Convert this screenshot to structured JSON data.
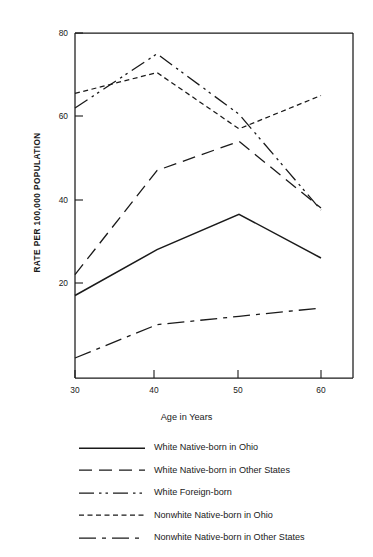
{
  "chart_data": {
    "type": "line",
    "title": "",
    "xlabel": "Age in Years",
    "ylabel": "RATE PER 100,000 POPULATION",
    "x": [
      30,
      40,
      50,
      60
    ],
    "xticks": [
      "30",
      "40",
      "50",
      "60"
    ],
    "yticks": [
      "20",
      "40",
      "60",
      "80"
    ],
    "xlim": [
      27.5,
      64
    ],
    "ylim": [
      0,
      82
    ],
    "grid": false,
    "legend_position": "below-plot",
    "series": [
      {
        "name": "White Native-born in Ohio",
        "line_style": "solid",
        "values": [
          17.0,
          28.0,
          36.5,
          26.0
        ]
      },
      {
        "name": "White Native-born in Other States",
        "line_style": "long-dash",
        "values": [
          22.0,
          47.0,
          54.0,
          38.0
        ]
      },
      {
        "name": "White Foreign-born",
        "line_style": "dash-dot-dot",
        "values": [
          62.0,
          75.0,
          60.5,
          37.5
        ]
      },
      {
        "name": "Nonwhite Native-born in Ohio",
        "line_style": "short-dash",
        "values": [
          65.5,
          70.5,
          57.0,
          65.0
        ]
      },
      {
        "name": "Nonwhite Native-born in Other States",
        "line_style": "dash-dot",
        "values": [
          2.0,
          10.0,
          12.0,
          14.0
        ]
      }
    ]
  },
  "axes": {
    "y_title": "RATE PER 100,000 POPULATION",
    "x_title": "Age in Years",
    "ytick_labels": [
      "80",
      "60",
      "40",
      "20"
    ],
    "xtick_labels": [
      "30",
      "40",
      "50",
      "60"
    ]
  },
  "legend": {
    "entries": [
      {
        "label": "White Native-born in Ohio",
        "style": "solid"
      },
      {
        "label": "White Native-born in Other States",
        "style": "long-dash"
      },
      {
        "label": "White Foreign-born",
        "style": "dash-dot-dot"
      },
      {
        "label": "Nonwhite Native-born in Ohio",
        "style": "short-dash"
      },
      {
        "label": "Nonwhite Native-born in Other States",
        "style": "dash-dot"
      }
    ]
  },
  "colors": {
    "line": "#1a1a1a",
    "axis": "#1a1a1a",
    "background": "#ffffff"
  }
}
